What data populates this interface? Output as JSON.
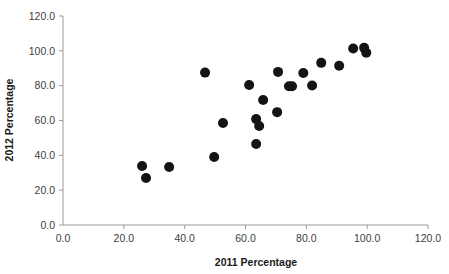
{
  "chart_data": {
    "type": "scatter",
    "title": "",
    "xlabel": "2011 Percentage",
    "ylabel": "2012 Percentage",
    "xlim": [
      0.0,
      120.0
    ],
    "ylim": [
      0.0,
      120.0
    ],
    "xticks": [
      "0.0",
      "20.0",
      "40.0",
      "60.0",
      "80.0",
      "100.0",
      "120.0"
    ],
    "yticks": [
      "0.0",
      "20.0",
      "40.0",
      "60.0",
      "80.0",
      "100.0",
      "120.0"
    ],
    "xtick_values": [
      0,
      20,
      40,
      60,
      80,
      100,
      120
    ],
    "ytick_values": [
      0,
      20,
      40,
      60,
      80,
      100,
      120
    ],
    "grid": false,
    "legend": null,
    "marker": "circle",
    "marker_color": "#141414",
    "marker_size": 5,
    "series": [
      {
        "name": "2011 vs 2012 Percentage",
        "points": [
          {
            "x": 26.0,
            "y": 33.9
          },
          {
            "x": 27.3,
            "y": 27.0
          },
          {
            "x": 34.9,
            "y": 33.3
          },
          {
            "x": 46.7,
            "y": 87.5
          },
          {
            "x": 49.7,
            "y": 39.0
          },
          {
            "x": 52.6,
            "y": 58.6
          },
          {
            "x": 61.2,
            "y": 80.4
          },
          {
            "x": 63.5,
            "y": 60.8
          },
          {
            "x": 63.5,
            "y": 46.5
          },
          {
            "x": 64.5,
            "y": 56.8
          },
          {
            "x": 65.8,
            "y": 71.8
          },
          {
            "x": 70.4,
            "y": 64.8
          },
          {
            "x": 70.7,
            "y": 87.9
          },
          {
            "x": 74.3,
            "y": 79.7
          },
          {
            "x": 75.3,
            "y": 79.7
          },
          {
            "x": 79.0,
            "y": 87.3
          },
          {
            "x": 81.9,
            "y": 80.1
          },
          {
            "x": 84.9,
            "y": 93.1
          },
          {
            "x": 90.8,
            "y": 91.4
          },
          {
            "x": 95.4,
            "y": 101.3
          },
          {
            "x": 99.0,
            "y": 101.7
          },
          {
            "x": 99.7,
            "y": 98.9
          }
        ]
      }
    ]
  },
  "axes": {
    "y_title": "2012 Percentage",
    "x_title": "2011 Percentage"
  }
}
